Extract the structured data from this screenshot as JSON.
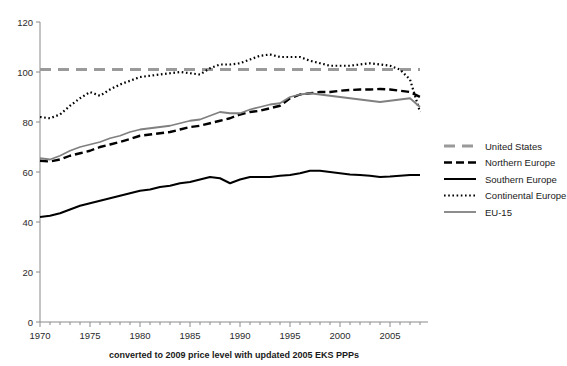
{
  "chart_data": {
    "type": "line",
    "title": "",
    "subtitle": "",
    "xlabel": "converted to 2009 price level with updated 2005 EKS PPPs",
    "ylabel": "",
    "xlim": [
      1970,
      2008.8
    ],
    "ylim": [
      0,
      120
    ],
    "y_ticks": [
      0,
      20,
      40,
      60,
      80,
      100,
      120
    ],
    "x_ticks": [
      1970,
      1975,
      1980,
      1985,
      1990,
      1995,
      2000,
      2005
    ],
    "x_minor_tick_step": 1,
    "grid": false,
    "legend_position": "right",
    "x": [
      1970,
      1971,
      1972,
      1973,
      1974,
      1975,
      1976,
      1977,
      1978,
      1979,
      1980,
      1981,
      1982,
      1983,
      1984,
      1985,
      1986,
      1987,
      1988,
      1989,
      1990,
      1991,
      1992,
      1993,
      1994,
      1995,
      1996,
      1997,
      1998,
      1999,
      2000,
      2001,
      2002,
      2003,
      2004,
      2005,
      2006,
      2007,
      2008
    ],
    "series": [
      {
        "name": "United States",
        "style": "dashed-thick-gray",
        "color": "#9a9a9a",
        "values": [
          101,
          101,
          101,
          101,
          101,
          101,
          101,
          101,
          101,
          101,
          101,
          101,
          101,
          101,
          101,
          101,
          101,
          101,
          101,
          101,
          101,
          101,
          101,
          101,
          101,
          101,
          101,
          101,
          101,
          101,
          101,
          101,
          101,
          101,
          101,
          101,
          101,
          101,
          101
        ]
      },
      {
        "name": "Northern Europe",
        "style": "dashed-black",
        "color": "#000000",
        "values": [
          64.5,
          64.2,
          65.0,
          66.5,
          67.5,
          68.5,
          70.0,
          71.0,
          72.0,
          73.2,
          74.5,
          75.0,
          75.5,
          76.0,
          77.0,
          78.0,
          78.5,
          79.5,
          80.5,
          81.5,
          83.0,
          84.0,
          84.5,
          85.5,
          86.5,
          89.5,
          91.0,
          91.5,
          92.0,
          92.0,
          92.5,
          92.8,
          93.0,
          93.0,
          93.2,
          93.0,
          92.5,
          92.0,
          90.0
        ]
      },
      {
        "name": "Southern Europe",
        "style": "solid-black",
        "color": "#000000",
        "values": [
          42.0,
          42.5,
          43.5,
          45.0,
          46.5,
          47.5,
          48.5,
          49.5,
          50.5,
          51.5,
          52.5,
          53.0,
          54.0,
          54.5,
          55.5,
          56.0,
          57.0,
          58.0,
          57.5,
          55.5,
          57.0,
          58.0,
          58.0,
          58.0,
          58.5,
          58.8,
          59.5,
          60.5,
          60.5,
          60.0,
          59.5,
          59.0,
          58.8,
          58.5,
          58.0,
          58.2,
          58.5,
          58.8,
          58.8
        ]
      },
      {
        "name": "Continental Europe",
        "style": "dotted-black",
        "color": "#000000",
        "values": [
          82.0,
          81.5,
          83.0,
          86.5,
          89.5,
          92.0,
          90.5,
          93.0,
          95.0,
          96.5,
          98.0,
          98.5,
          99.0,
          99.5,
          100.0,
          99.5,
          99.0,
          101.5,
          103.0,
          103.0,
          103.5,
          105.0,
          106.5,
          107.0,
          106.0,
          106.0,
          106.0,
          104.5,
          103.5,
          102.5,
          102.5,
          102.5,
          103.0,
          103.5,
          103.0,
          102.5,
          101.0,
          97.0,
          84.0
        ]
      },
      {
        "name": "EU-15",
        "style": "solid-gray",
        "color": "#808080",
        "values": [
          65.5,
          65.0,
          66.5,
          68.5,
          70.0,
          71.0,
          72.0,
          73.5,
          74.5,
          76.0,
          77.0,
          77.5,
          78.0,
          78.5,
          79.5,
          80.5,
          81.0,
          82.5,
          84.0,
          83.5,
          83.5,
          85.0,
          86.0,
          87.0,
          87.5,
          90.0,
          91.0,
          91.5,
          91.0,
          90.5,
          90.0,
          89.5,
          89.0,
          88.5,
          88.0,
          88.5,
          89.0,
          89.5,
          86.0
        ]
      }
    ]
  },
  "legend": {
    "items": [
      {
        "label": "United States"
      },
      {
        "label": "Northern Europe"
      },
      {
        "label": "Southern Europe"
      },
      {
        "label": "Continental Europe"
      },
      {
        "label": "EU-15"
      }
    ]
  },
  "axis": {
    "y_tick_labels": [
      "120",
      "100",
      "80",
      "60",
      "40",
      "20",
      "0"
    ],
    "x_tick_labels": [
      "1970",
      "1975",
      "1980",
      "1985",
      "1990",
      "1995",
      "2000",
      "2005"
    ],
    "caption": "converted to 2009 price level with updated 2005 EKS PPPs"
  }
}
